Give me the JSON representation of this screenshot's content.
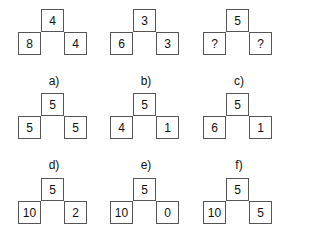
{
  "figures": [
    {
      "label": "",
      "top": "4",
      "left": "8",
      "right": "4"
    },
    {
      "label": "",
      "top": "3",
      "left": "6",
      "right": "3"
    },
    {
      "label": "",
      "top": "5",
      "left": "?",
      "right": "?"
    },
    {
      "label": "a)",
      "top": "5",
      "left": "5",
      "right": "5"
    },
    {
      "label": "b)",
      "top": "5",
      "left": "4",
      "right": "1"
    },
    {
      "label": "c)",
      "top": "5",
      "left": "6",
      "right": "1"
    },
    {
      "label": "d)",
      "top": "5",
      "left": "10",
      "right": "2"
    },
    {
      "label": "e)",
      "top": "5",
      "left": "10",
      "right": "0"
    },
    {
      "label": "f)",
      "top": "5",
      "left": "10",
      "right": "5"
    }
  ]
}
